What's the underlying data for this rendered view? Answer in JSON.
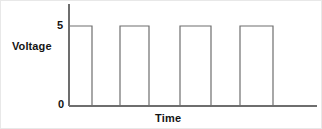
{
  "figure": {
    "background_color": "#ffffff",
    "line_color": "#6e6e6e",
    "text_color": "#141414",
    "width": 322,
    "height": 129
  },
  "labels": {
    "y_axis_title": "Voltage",
    "x_axis_title": "Time",
    "y_tick_high": "5",
    "y_tick_low": "0"
  },
  "chart_data": {
    "type": "line",
    "title": "",
    "subtitle": "",
    "xlabel": "Time",
    "ylabel": "Voltage",
    "series": [
      {
        "name": "Voltage",
        "x": [
          0,
          0,
          23,
          23,
          51,
          51,
          80,
          80,
          111,
          111,
          142,
          142,
          171,
          171,
          204,
          204,
          248
        ],
        "y": [
          0,
          5,
          5,
          0,
          0,
          5,
          5,
          0,
          0,
          5,
          5,
          0,
          0,
          5,
          5,
          0,
          0
        ],
        "pulses": [
          {
            "start": 0,
            "end": 23,
            "level": 5
          },
          {
            "start": 51,
            "end": 80,
            "level": 5
          },
          {
            "start": 111,
            "end": 142,
            "level": 5
          },
          {
            "start": 171,
            "end": 204,
            "level": 5
          }
        ]
      }
    ],
    "yticks": [
      0,
      5
    ],
    "ytick_labels": [
      "0",
      "5"
    ],
    "xticks": [],
    "xtick_labels": [],
    "ylim": [
      0,
      5
    ],
    "xlim": [
      0,
      248
    ],
    "grid": false,
    "legend": false,
    "legend_position": "none"
  },
  "geometry": {
    "y_axis_x": 68,
    "y_axis_top": 3,
    "baseline_y": 105,
    "high_y": 25,
    "x_axis_end": 316,
    "pulses_px": [
      {
        "x1": 68,
        "x2": 91
      },
      {
        "x1": 119,
        "x2": 148
      },
      {
        "x1": 179,
        "x2": 210
      },
      {
        "x1": 239,
        "x2": 272
      }
    ]
  }
}
